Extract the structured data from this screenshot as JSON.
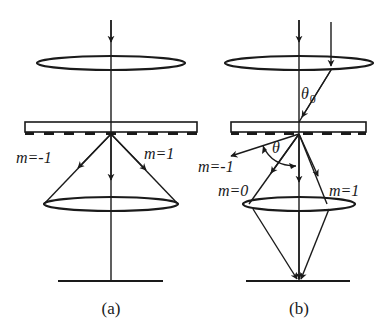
{
  "diagram": {
    "panels": [
      {
        "id": "a",
        "caption": "(a)",
        "labels": {
          "m_minus": "m=-1",
          "m_plus": "m=1"
        }
      },
      {
        "id": "b",
        "caption": "(b)",
        "labels": {
          "theta0_symbol": "θ",
          "theta0_sub": "0",
          "theta": "θ",
          "m_minus": "m=-1",
          "m_zero": "m=0",
          "m_plus": "m=1"
        }
      }
    ],
    "colors": {
      "ink": "#1a1a1a",
      "background": "#ffffff"
    }
  }
}
